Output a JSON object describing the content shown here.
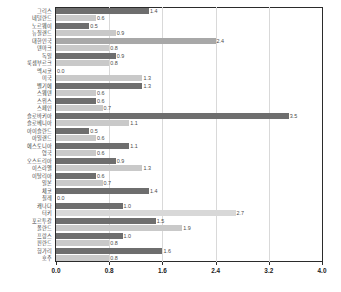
{
  "chart_data": {
    "type": "bar",
    "orientation": "horizontal",
    "title": "",
    "subtitle": "",
    "xlabel": "",
    "ylabel": "",
    "xlim": [
      0.0,
      4.0
    ],
    "xticks": [
      "0.0",
      "0.8",
      "1.6",
      "2.4",
      "3.2",
      "4.0"
    ],
    "xtick_values": [
      0.0,
      0.8,
      1.6,
      2.4,
      3.2,
      4.0
    ],
    "grid": true,
    "grid_axis": "x",
    "legend": false,
    "legend_position": "none",
    "categories": [
      "그리스",
      "네덜란드",
      "노르웨이",
      "뉴질랜드",
      "대한민국",
      "덴마크",
      "독일",
      "룩셈부르크",
      "멕시코",
      "미국",
      "벨기에",
      "스웨덴",
      "스위스",
      "스페인",
      "슬로바키아",
      "슬로베니아",
      "아이슬란드",
      "아일랜드",
      "에스토니아",
      "영국",
      "오스트리아",
      "이스라엘",
      "이탈리아",
      "일본",
      "체코",
      "칠레",
      "캐나다",
      "터키",
      "포르투갈",
      "폴란드",
      "프랑스",
      "핀란드",
      "헝가리",
      "호주"
    ],
    "values": [
      1.4,
      0.6,
      0.5,
      0.9,
      2.4,
      0.8,
      0.9,
      0.8,
      0.0,
      1.3,
      1.3,
      0.6,
      0.6,
      0.7,
      3.5,
      1.1,
      0.5,
      0.6,
      1.1,
      0.6,
      0.9,
      1.3,
      0.6,
      0.7,
      1.4,
      0.0,
      1.0,
      2.7,
      1.5,
      1.9,
      1.0,
      0.8,
      1.6,
      0.8
    ],
    "value_labels": [
      "1.4",
      "0.6",
      "0.5",
      "0.9",
      "2.4",
      "0.8",
      "0.9",
      "0.8",
      "0.0",
      "1.3",
      "1.3",
      "0.6",
      "0.6",
      "0.7",
      "3.5",
      "1.1",
      "0.5",
      "0.6",
      "1.1",
      "0.6",
      "0.9",
      "1.3",
      "0.6",
      "0.7",
      "1.4",
      "0.0",
      "1.0",
      "2.7",
      "1.5",
      "1.9",
      "1.0",
      "0.8",
      "1.6",
      "0.8"
    ],
    "bar_colors": [
      "#6e6e6e",
      "#c9c9c9",
      "#6e6e6e",
      "#c9c9c9",
      "#a8a8a8",
      "#c9c9c9",
      "#6e6e6e",
      "#c9c9c9",
      "#6e6e6e",
      "#c9c9c9",
      "#6e6e6e",
      "#c9c9c9",
      "#6e6e6e",
      "#c9c9c9",
      "#6e6e6e",
      "#c9c9c9",
      "#6e6e6e",
      "#c9c9c9",
      "#6e6e6e",
      "#c9c9c9",
      "#6e6e6e",
      "#c9c9c9",
      "#6e6e6e",
      "#c9c9c9",
      "#6e6e6e",
      "#c9c9c9",
      "#6e6e6e",
      "#d8d8d8",
      "#6e6e6e",
      "#c9c9c9",
      "#6e6e6e",
      "#c9c9c9",
      "#6e6e6e",
      "#c9c9c9"
    ]
  },
  "colors": {
    "bar_dark": "#6e6e6e",
    "bar_light": "#c9c9c9",
    "bar_highlight": "#a8a8a8",
    "frame": "#2b2b2b",
    "gridline": "#d9d9d9",
    "label_text": "#3c3c3c",
    "tick_text": "#1a1a1a",
    "background": "#ffffff"
  }
}
